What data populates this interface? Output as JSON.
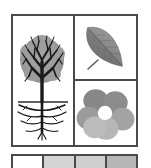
{
  "figure": {
    "border_color": "#4a4a4a",
    "background_color": "#ffffff"
  },
  "grid": {
    "name": "plant-parts-grid",
    "cells": [
      {
        "id": "tree",
        "label": "Tree with roots",
        "icon": "tree-with-roots-icon",
        "canopy_color": "#9a9a9a",
        "branch_color": "#1e1e1e",
        "ground_line_color": "#2b2b2b",
        "root_color": "#1e1e1e"
      },
      {
        "id": "leaf",
        "label": "Leaf",
        "icon": "leaf-icon",
        "blade_color": "#8e8e8e",
        "shade_color": "#6d6d6d",
        "vein_color": "#5a5a5a",
        "stem_color": "#5a5a5a"
      },
      {
        "id": "flower",
        "label": "Flower with five petals",
        "icon": "flower-icon",
        "petal_color_top": "#8c8c8c",
        "petal_color_side": "#9e9e9e",
        "petal_color_bottom": "#b4b4b4",
        "center_color": "#ffffff",
        "petal_count": 5
      }
    ]
  },
  "swatch_row": {
    "name": "gray-swatch-row",
    "swatches": [
      {
        "id": "swatch-1",
        "label": "White",
        "color": "#ffffff"
      },
      {
        "id": "swatch-2",
        "label": "Light gray",
        "color": "#d4d4d4"
      },
      {
        "id": "swatch-3",
        "label": "Light medium gray",
        "color": "#cfcfcf"
      },
      {
        "id": "swatch-4",
        "label": "Medium gray",
        "color": "#b6b6b6"
      }
    ]
  }
}
